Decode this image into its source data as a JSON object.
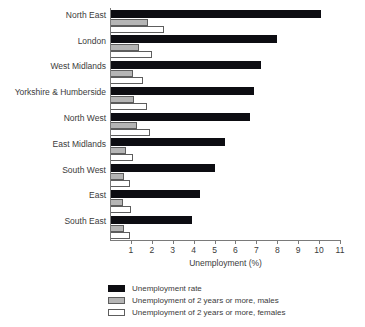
{
  "chart_data": {
    "type": "bar",
    "orientation": "horizontal",
    "title": "",
    "xlabel": "Unemployment (%)",
    "ylabel": "",
    "xlim": [
      0,
      11
    ],
    "xticks": [
      1,
      2,
      3,
      4,
      5,
      6,
      7,
      8,
      9,
      10,
      11
    ],
    "grid": false,
    "legend_position": "bottom-left",
    "categories": [
      "North East",
      "London",
      "West Midlands",
      "Yorkshire & Humberside",
      "North West",
      "East Midlands",
      "South West",
      "East",
      "South East"
    ],
    "series": [
      {
        "name": "Unemployment rate",
        "color": "#0d0d12",
        "values": [
          10.1,
          8.0,
          7.2,
          6.9,
          6.7,
          5.5,
          5.0,
          4.3,
          3.9
        ]
      },
      {
        "name": "Unemployment of 2 years or more, males",
        "color": "#b5b5b5",
        "values": [
          1.8,
          1.4,
          1.1,
          1.15,
          1.3,
          0.75,
          0.65,
          0.6,
          0.65
        ]
      },
      {
        "name": "Unemployment of 2 years or more, females",
        "color": "#ffffff",
        "values": [
          2.6,
          2.0,
          1.6,
          1.75,
          1.9,
          1.1,
          0.95,
          1.0,
          0.95
        ]
      }
    ]
  },
  "legend": {
    "items": [
      "Unemployment rate",
      "Unemployment of 2 years or more, males",
      "Unemployment of 2 years or more, females"
    ]
  }
}
